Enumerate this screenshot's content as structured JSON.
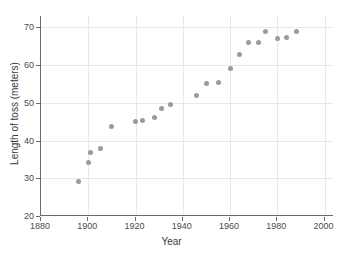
{
  "chart_data": {
    "type": "scatter",
    "title": "",
    "xlabel": "Year",
    "ylabel": "Length of toss (meters)",
    "xlim": [
      1880,
      2004
    ],
    "ylim": [
      20,
      73
    ],
    "xticks": [
      1880,
      1900,
      1920,
      1940,
      1960,
      1980,
      2000
    ],
    "yticks": [
      20,
      30,
      40,
      50,
      60,
      70
    ],
    "grid": true,
    "legend": "none",
    "marker_color": "#9a9a9a",
    "axis_color": "#6b6b6b",
    "grid_color": "#e8e8e8",
    "series": [
      {
        "name": "Length of toss",
        "points": [
          {
            "x": 1896,
            "y": 29.2
          },
          {
            "x": 1900,
            "y": 34.2
          },
          {
            "x": 1901,
            "y": 36.8
          },
          {
            "x": 1905,
            "y": 38.0
          },
          {
            "x": 1910,
            "y": 43.6
          },
          {
            "x": 1920,
            "y": 45.0
          },
          {
            "x": 1923,
            "y": 45.4
          },
          {
            "x": 1928,
            "y": 46.2
          },
          {
            "x": 1931,
            "y": 48.6
          },
          {
            "x": 1935,
            "y": 49.5
          },
          {
            "x": 1946,
            "y": 52.0
          },
          {
            "x": 1950,
            "y": 55.1
          },
          {
            "x": 1955,
            "y": 55.4
          },
          {
            "x": 1960,
            "y": 59.0
          },
          {
            "x": 1964,
            "y": 62.8
          },
          {
            "x": 1968,
            "y": 66.0
          },
          {
            "x": 1972,
            "y": 65.9
          },
          {
            "x": 1975,
            "y": 68.8
          },
          {
            "x": 1980,
            "y": 67.0
          },
          {
            "x": 1984,
            "y": 67.2
          },
          {
            "x": 1988,
            "y": 69.0
          }
        ]
      }
    ]
  }
}
